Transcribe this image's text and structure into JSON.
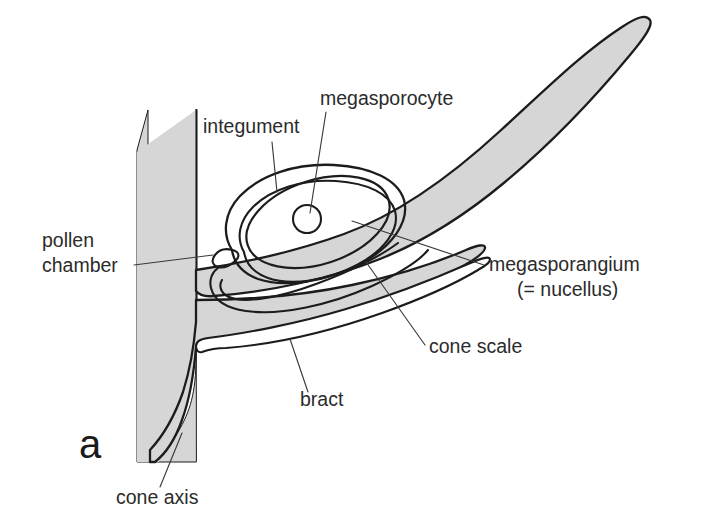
{
  "figure": {
    "panel_letter": "a",
    "background_color": "#ffffff",
    "tissue_fill_color": "#d6d6d6",
    "outline_color": "#1c1c1c",
    "leader_color": "#3a3a3a",
    "text_color": "#2b2b2b"
  },
  "labels": [
    {
      "id": "integument",
      "text": "integument",
      "lines": [
        "integument"
      ],
      "text_anchor": "start",
      "x": 203,
      "y": 133,
      "leader": "M 272,142 L 277,192"
    },
    {
      "id": "megasporocyte",
      "text": "megasporocyte",
      "lines": [
        "megasporocyte"
      ],
      "text_anchor": "start",
      "x": 320,
      "y": 105,
      "leader": "M 326,112 L 310,213"
    },
    {
      "id": "pollen-chamber",
      "text": "pollen chamber",
      "lines": [
        "pollen",
        "chamber"
      ],
      "text_anchor": "start",
      "x": 42,
      "y": 247,
      "leader": "M 134,265 L 213,255"
    },
    {
      "id": "megasporangium",
      "text": "megasporangium (= nucellus)",
      "lines": [
        "megasporangium",
        "(= nucellus)"
      ],
      "text_anchor": "start",
      "x": 489,
      "y": 271,
      "leader": "M 484,265 L 352,221"
    },
    {
      "id": "cone-scale",
      "text": "cone scale",
      "lines": [
        "cone scale"
      ],
      "text_anchor": "start",
      "x": 429,
      "y": 353,
      "leader": "M 425,345 L 366,262"
    },
    {
      "id": "bract",
      "text": "bract",
      "lines": [
        "bract"
      ],
      "text_anchor": "start",
      "x": 300,
      "y": 406,
      "leader": "M 308,392 L 290,339"
    },
    {
      "id": "cone-axis",
      "text": "cone axis",
      "lines": [
        "cone axis"
      ],
      "text_anchor": "start",
      "x": 116,
      "y": 504,
      "leader": "M 160,487 L 182,433"
    }
  ],
  "structures": [
    {
      "id": "cone-axis-slab",
      "name": "cone axis",
      "fill": "#d6d6d6"
    },
    {
      "id": "cone-scale-body",
      "name": "cone scale",
      "fill": "#d6d6d6"
    },
    {
      "id": "bract-body",
      "name": "bract",
      "fill": "#d6d6d6"
    },
    {
      "id": "integument-outline",
      "name": "integument",
      "fill": "none"
    },
    {
      "id": "nucellus-outline",
      "name": "megasporangium (= nucellus)",
      "fill": "none"
    },
    {
      "id": "megasporocyte-cell",
      "name": "megasporocyte",
      "fill": "none"
    },
    {
      "id": "pollen-chamber-tip",
      "name": "pollen chamber",
      "fill": "none"
    }
  ]
}
